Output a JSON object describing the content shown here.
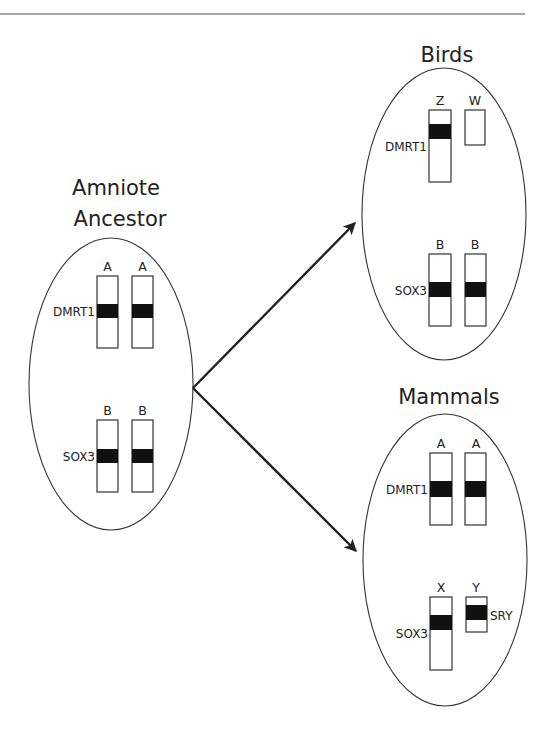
{
  "figure": {
    "top_rule_color": "#8a8a8a",
    "ink_color": "#222222",
    "band_color": "#111111"
  },
  "ancestor": {
    "title_line1": "Amniote",
    "title_line2": "Ancestor",
    "pairs": [
      {
        "labels": [
          "A",
          "A"
        ],
        "gene": "DMRT1"
      },
      {
        "labels": [
          "B",
          "B"
        ],
        "gene": "SOX3"
      }
    ]
  },
  "birds": {
    "title": "Birds",
    "pairs": [
      {
        "labels": [
          "Z",
          "W"
        ],
        "gene": "DMRT1"
      },
      {
        "labels": [
          "B",
          "B"
        ],
        "gene": "SOX3"
      }
    ]
  },
  "mammals": {
    "title": "Mammals",
    "pairs": [
      {
        "labels": [
          "A",
          "A"
        ],
        "gene": "DMRT1"
      },
      {
        "labels": [
          "X",
          "Y"
        ],
        "gene": "SOX3",
        "y_gene": "SRY"
      }
    ]
  },
  "arrows": [
    {
      "from": "ancestor",
      "to": "birds"
    },
    {
      "from": "ancestor",
      "to": "mammals"
    }
  ]
}
